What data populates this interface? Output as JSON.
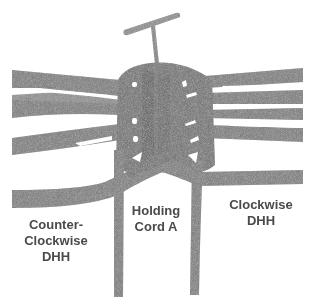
{
  "diagram": {
    "colors": {
      "cord": "#7a7a7a",
      "cord_dark": "#5e5e5e",
      "background": "#ffffff",
      "text": "#4a4a4a"
    },
    "elements": {
      "pin": "T-pin",
      "holding_cord": "Holding Cord A",
      "left_knots": "Counter-Clockwise DHH",
      "right_knots": "Clockwise DHH"
    }
  },
  "labels": {
    "counter_clockwise": {
      "line1": "Counter-",
      "line2": "Clockwise",
      "line3": "DHH"
    },
    "holding_cord": {
      "line1": "Holding",
      "line2": "Cord A"
    },
    "clockwise": {
      "line1": "Clockwise",
      "line2": "DHH"
    }
  }
}
